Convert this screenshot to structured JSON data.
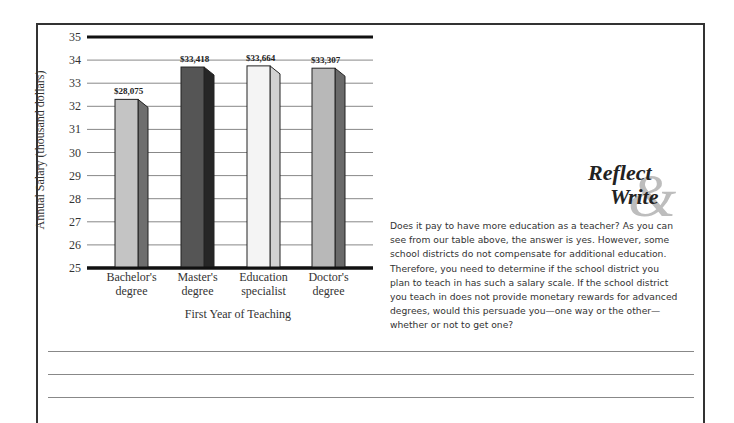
{
  "chart_data": {
    "type": "bar",
    "style": "3d-bar",
    "title": "",
    "xlabel": "First Year of Teaching",
    "ylabel": "Annual Salary (thousand dollars)",
    "ylim": [
      25,
      35
    ],
    "yticks": [
      25,
      26,
      27,
      28,
      29,
      30,
      31,
      32,
      33,
      34,
      35
    ],
    "grid": true,
    "legend": null,
    "categories": [
      "Bachelor's degree",
      "Master's degree",
      "Education specialist",
      "Doctor's degree"
    ],
    "category_lines": [
      [
        "Bachelor's",
        "degree"
      ],
      [
        "Master's",
        "degree"
      ],
      [
        "Education",
        "specialist"
      ],
      [
        "Doctor's",
        "degree"
      ]
    ],
    "values": [
      28.075,
      33.418,
      33.664,
      33.307
    ],
    "drawn_heights": [
      32.3,
      33.7,
      33.75,
      33.65
    ],
    "data_labels": [
      "$28,075",
      "$33,418",
      "$33,664",
      "$33,307"
    ],
    "bar_colors": [
      {
        "front": "#c4c4c4",
        "side": "#6e6e6e"
      },
      {
        "front": "#555555",
        "side": "#262626"
      },
      {
        "front": "#f4f4f4",
        "side": "#d2d2d2"
      },
      {
        "front": "#b8b8b8",
        "side": "#6a6a6a"
      }
    ]
  },
  "sidebar_box": {
    "logo_word1": "Reflect",
    "logo_amp": "&",
    "logo_word2": "Write",
    "prompt": "Does it pay to have more education as a teacher? As you can see from our table above, the answer is yes. However, some school districts do not compensate for additional education. Therefore, you need to determine if the school district you plan to teach in has such a salary scale. If the school district you teach in does not provide monetary rewards for advanced degrees, would this persuade you—one way or the other—whether or not to get one?",
    "prompt_lines": [
      "Does it pay to have more education as a teacher? As you can",
      "see from our table above, the answer is yes. However, some",
      "school districts do not compensate for additional education.",
      "Therefore, you need to determine if the school district you",
      "plan to teach in has such a salary scale. If the school district",
      "you teach in does not provide monetary rewards for advanced",
      "degrees, would this persuade you—one way or the other—",
      "whether or not to get one?"
    ]
  },
  "writing_lines_count": 3
}
